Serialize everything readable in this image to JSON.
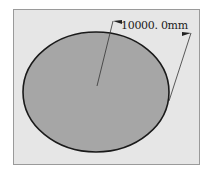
{
  "drawing": {
    "shape": "ellipse",
    "dimension": {
      "type": "radius",
      "value_label": "10000. 0mm"
    },
    "colors": {
      "background": "#ffffff",
      "frame_fill": "#e6e6e6",
      "ellipse_fill": "#a6a6a6",
      "outline": "#1a1a1a"
    }
  }
}
